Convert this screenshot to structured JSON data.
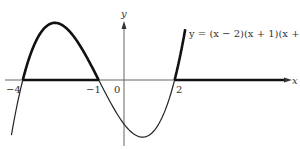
{
  "figure": {
    "equation_label": "y = (x − 2)(x + 1)(x + 4)",
    "x_axis_label": "x",
    "y_axis_label": "y",
    "tick_labels": [
      "−4",
      "−1",
      "0",
      "2"
    ],
    "colors": {
      "curve": "#111111",
      "axis": "#444444",
      "text": "#333333"
    }
  },
  "chart_data": {
    "type": "line",
    "title": "",
    "function": "y = (x - 2)(x + 1)(x + 4)",
    "xlabel": "x",
    "ylabel": "y",
    "roots": [
      -4,
      -1,
      2
    ],
    "x_ticks": [
      -4,
      -1,
      0,
      2
    ],
    "highlighted_intervals": [
      [
        -4,
        -1
      ],
      [
        2,
        2.4
      ]
    ],
    "highlight_note": "Curve drawn bold where y >= 0; x-axis drawn bold on [-4,-1] and [2, +inf)",
    "series": [
      {
        "name": "y = (x - 2)(x + 1)(x + 4)",
        "x": [
          -4.45,
          -4,
          -3.5,
          -3,
          -2.5,
          -2,
          -1.5,
          -1,
          -0.5,
          0,
          0.5,
          0.8,
          1,
          1.5,
          2,
          2.2,
          2.4
        ],
        "y": [
          -10.9,
          0,
          6.9,
          10,
          10.1,
          8,
          4.4,
          0,
          -4.4,
          -8,
          -10.1,
          -10.4,
          -10,
          -6.9,
          0,
          4.6,
          10.1
        ]
      }
    ],
    "grid": false,
    "legend": "none"
  }
}
